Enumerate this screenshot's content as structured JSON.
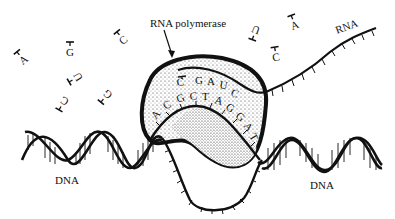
{
  "labels": {
    "rna_polymerase": "RNA polymerase",
    "rna": "RNA",
    "dna_left": "DNA",
    "dna_right": "DNA"
  },
  "free_nucleotides": [
    {
      "base": "A",
      "x": 22,
      "y": 58,
      "rot": -40
    },
    {
      "base": "G",
      "x": 70,
      "y": 50,
      "rot": 0
    },
    {
      "base": "C",
      "x": 122,
      "y": 38,
      "rot": -40
    },
    {
      "base": "U",
      "x": 76,
      "y": 78,
      "rot": -120
    },
    {
      "base": "G",
      "x": 106,
      "y": 96,
      "rot": -140
    },
    {
      "base": "C",
      "x": 63,
      "y": 103,
      "rot": -150
    },
    {
      "base": "U",
      "x": 255,
      "y": 32,
      "rot": -160
    },
    {
      "base": "A",
      "x": 294,
      "y": 23,
      "rot": -20
    },
    {
      "base": "C",
      "x": 276,
      "y": 55,
      "rot": -10
    }
  ],
  "rna_bases_in_polymerase": [
    "C",
    "G",
    "A",
    "U",
    "C"
  ],
  "dna_template_bases": [
    "A",
    "C",
    "G",
    "C",
    "T",
    "A",
    "G",
    "G",
    "A",
    "T"
  ]
}
